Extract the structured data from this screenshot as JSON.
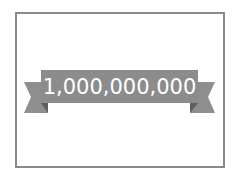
{
  "banner": {
    "text": "1,000,000,000"
  },
  "colors": {
    "frame_border": "#8a8a8a",
    "ribbon_main": "#8c8c8c",
    "ribbon_tail": "#8e8e8e",
    "ribbon_fold": "#5e5e5e",
    "text": "#ffffff",
    "background": "#ffffff"
  }
}
